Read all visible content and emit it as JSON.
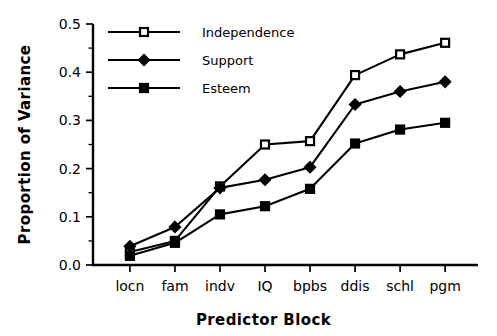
{
  "chart_data": {
    "type": "line",
    "title": "",
    "xlabel": "Predictor  Block",
    "ylabel": "Proportion of Variance",
    "categories": [
      "locn",
      "fam",
      "indv",
      "IQ",
      "bpbs",
      "ddis",
      "schl",
      "pgm"
    ],
    "ylim": [
      0.0,
      0.5
    ],
    "xlim": [
      0,
      9
    ],
    "ytick_labels": [
      "0.0",
      "0.1",
      "0.2",
      "0.3",
      "0.4",
      "0.5"
    ],
    "ytick_values": [
      0.0,
      0.1,
      0.2,
      0.3,
      0.4,
      0.5
    ],
    "yminor_tick_values": [
      0.05,
      0.15,
      0.25,
      0.35,
      0.45
    ],
    "grid": false,
    "legend_position": "upper-left-inside",
    "series": [
      {
        "name": "Independence",
        "marker": "open-square",
        "values": [
          0.027,
          0.05,
          0.163,
          0.25,
          0.257,
          0.394,
          0.437,
          0.461
        ]
      },
      {
        "name": "Support",
        "marker": "diamond",
        "values": [
          0.039,
          0.079,
          0.16,
          0.177,
          0.203,
          0.333,
          0.36,
          0.38
        ]
      },
      {
        "name": "Esteem",
        "marker": "filled-square",
        "values": [
          0.019,
          0.046,
          0.105,
          0.122,
          0.158,
          0.252,
          0.281,
          0.295
        ]
      }
    ],
    "colors": {
      "line": "#000000",
      "background": "#ffffff",
      "marker_open_fill": "#ffffff",
      "marker_fill": "#000000"
    }
  }
}
